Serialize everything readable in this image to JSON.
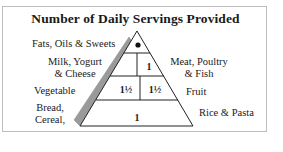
{
  "title": "Number of Daily Servings Provided",
  "pyramid": {
    "levels": [
      {
        "left_label": "Fats, Oils & Sweets",
        "value": "•"
      },
      {
        "left_label": "Milk, Yogurt & Cheese",
        "right_label": "Meat, Poultry & Fish",
        "left_value": "",
        "right_value": "1"
      },
      {
        "left_label": "Vegetable",
        "right_label": "Fruit",
        "left_value": "1½",
        "right_value": "1½"
      },
      {
        "left_label": "Bread, Cereal,",
        "right_label": "Rice & Pasta",
        "value": "1"
      }
    ]
  },
  "labels": {
    "fats": "Fats, Oils & Sweets",
    "milk_1": "Milk, Yogurt",
    "milk_2": "& Cheese",
    "meat_1": "Meat, Poultry",
    "meat_2": "& Fish",
    "vegetable": "Vegetable",
    "fruit": "Fruit",
    "bread_1": "Bread,",
    "bread_2": "Cereal,",
    "rice": "Rice & Pasta"
  },
  "values": {
    "fats": "•",
    "milk": "",
    "meat": "1",
    "vegetable": "1½",
    "fruit": "1½",
    "bread": "1"
  },
  "colors": {
    "shadow": "#9a9a9a",
    "line": "#222222",
    "frame": "#bdbdbd"
  }
}
